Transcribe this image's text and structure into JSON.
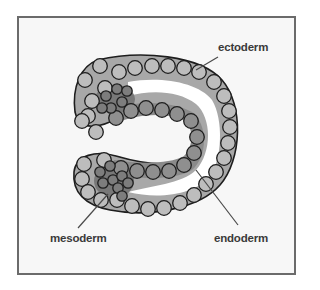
{
  "colors": {
    "frame": "#6b6b6b",
    "background": "#f7f7f7",
    "ectoderm_fill": "#bdbdbd",
    "ectoderm_band": "#a8a8a8",
    "endoderm_fill": "#8f8f8f",
    "endoderm_band": "#8a8a8a",
    "mesoderm_fill": "#7d7d7d",
    "mesoderm_band": "#787878",
    "outline": "#1e1e1e",
    "label": "#3a3a3a",
    "leader": "#4a4a4a"
  },
  "labels": {
    "ectoderm": {
      "text": "ectoderm",
      "x": 218,
      "y": 41
    },
    "mesoderm": {
      "text": "mesoderm",
      "x": 50,
      "y": 232
    },
    "endoderm": {
      "text": "endoderm",
      "x": 214,
      "y": 232
    }
  },
  "leaders": {
    "ectoderm": [
      218,
      57,
      196,
      70
    ],
    "mesoderm": [
      78,
      228,
      108,
      194
    ],
    "endoderm": [
      238,
      225,
      196,
      170
    ]
  },
  "cells": {
    "ectoderm": [
      [
        119,
        72
      ],
      [
        135,
        68
      ],
      [
        152,
        66
      ],
      [
        168,
        66
      ],
      [
        184,
        68
      ],
      [
        199,
        72
      ],
      [
        214,
        82
      ],
      [
        224,
        96
      ],
      [
        229,
        111
      ],
      [
        230,
        127
      ],
      [
        228,
        143
      ],
      [
        224,
        158
      ],
      [
        216,
        172
      ],
      [
        206,
        184
      ],
      [
        194,
        195
      ],
      [
        180,
        203
      ],
      [
        164,
        208
      ],
      [
        148,
        209
      ],
      [
        132,
        206
      ],
      [
        117,
        200
      ],
      [
        105,
        88
      ],
      [
        92,
        101
      ],
      [
        88,
        116
      ],
      [
        96,
        132
      ],
      [
        82,
        121
      ],
      [
        100,
        66
      ],
      [
        85,
        80
      ],
      [
        84,
        164
      ],
      [
        82,
        179
      ],
      [
        88,
        192
      ],
      [
        101,
        200
      ],
      [
        104,
        160
      ]
    ],
    "endoderm": [
      [
        116,
        118
      ],
      [
        131,
        111
      ],
      [
        146,
        108
      ],
      [
        162,
        110
      ],
      [
        177,
        114
      ],
      [
        191,
        121
      ],
      [
        197,
        137
      ],
      [
        194,
        153
      ],
      [
        184,
        165
      ],
      [
        169,
        171
      ],
      [
        153,
        172
      ],
      [
        137,
        171
      ],
      [
        121,
        168
      ]
    ],
    "mesoderm": [
      [
        106,
        96
      ],
      [
        117,
        89
      ],
      [
        127,
        91
      ],
      [
        111,
        108
      ],
      [
        122,
        102
      ],
      [
        102,
        108
      ],
      [
        100,
        172
      ],
      [
        110,
        166
      ],
      [
        103,
        183
      ],
      [
        113,
        180
      ],
      [
        122,
        176
      ],
      [
        118,
        188
      ],
      [
        128,
        183
      ],
      [
        122,
        196
      ]
    ]
  }
}
